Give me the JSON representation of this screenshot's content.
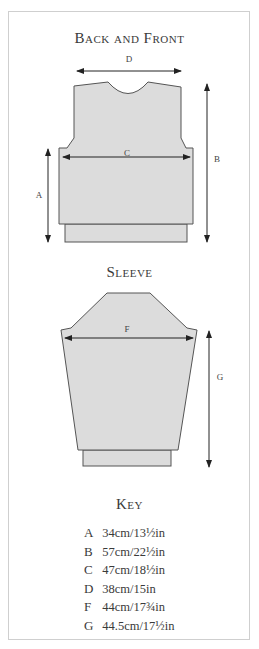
{
  "back_front": {
    "title": "Back and Front",
    "labels": {
      "D": "D",
      "C": "C",
      "A": "A",
      "B": "B"
    }
  },
  "sleeve": {
    "title": "Sleeve",
    "labels": {
      "F": "F",
      "G": "G"
    }
  },
  "key": {
    "title": "Key",
    "items": [
      {
        "letter": "A",
        "value": "34cm/13½in"
      },
      {
        "letter": "B",
        "value": "57cm/22½in"
      },
      {
        "letter": "C",
        "value": "47cm/18½in"
      },
      {
        "letter": "D",
        "value": "38cm/15in"
      },
      {
        "letter": "F",
        "value": "44cm/17¾in"
      },
      {
        "letter": "G",
        "value": "44.5cm/17½in"
      }
    ]
  },
  "colors": {
    "piece_fill": "#dcdcdc",
    "outline": "#555555",
    "arrow": "#222222",
    "frame": "#cfcfcf"
  }
}
